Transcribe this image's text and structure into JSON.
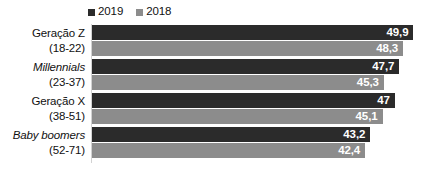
{
  "chart_data": {
    "type": "bar",
    "orientation": "horizontal",
    "title": "",
    "subtitle": "",
    "xlabel": "",
    "ylabel": "",
    "grid": false,
    "legend_position": "top-left",
    "xlim": [
      0,
      52
    ],
    "categories": [
      {
        "name": "Geração Z",
        "range": "(18-22)",
        "italic": false
      },
      {
        "name": "Millennials",
        "range": "(23-37)",
        "italic": true
      },
      {
        "name": "Geração X",
        "range": "(38-51)",
        "italic": false
      },
      {
        "name": "Baby boomers",
        "range": "(52-71)",
        "italic": true
      }
    ],
    "series": [
      {
        "name": "2019",
        "color": "#2b2b2b",
        "values": [
          49.9,
          47.7,
          47,
          43.2
        ],
        "labels": [
          "49,9",
          "47,7",
          "47",
          "43,2"
        ]
      },
      {
        "name": "2018",
        "color": "#8c8c8c",
        "values": [
          48.3,
          45.3,
          45.1,
          42.4
        ],
        "labels": [
          "48,3",
          "45,3",
          "45,1",
          "42,4"
        ]
      }
    ]
  },
  "legend": {
    "items": [
      {
        "label": "2019",
        "color": "#2b2b2b",
        "icon": "square-marker-icon"
      },
      {
        "label": "2018",
        "color": "#8c8c8c",
        "icon": "square-marker-icon"
      }
    ]
  }
}
